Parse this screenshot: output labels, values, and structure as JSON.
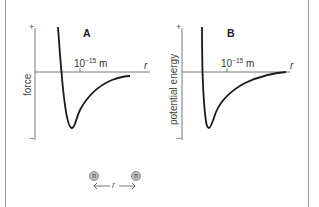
{
  "figure": {
    "panels": [
      {
        "id": "A",
        "label": "A",
        "ylabel": "force",
        "y_plus": "+",
        "y_minus": "−",
        "x_axis_label": "r",
        "tick_label_base": "10",
        "tick_label_exp": "−15",
        "tick_label_unit": " m"
      },
      {
        "id": "B",
        "label": "B",
        "ylabel": "potential energy",
        "y_plus": "+",
        "y_minus": "−",
        "x_axis_label": "r",
        "tick_label_base": "10",
        "tick_label_exp": "−15",
        "tick_label_unit": " m"
      }
    ],
    "inset": {
      "particle_left": "n",
      "particle_right": "n",
      "separation_label": "r",
      "arrow_left": "←",
      "arrow_right": "→"
    },
    "colors": {
      "curve": "#1a1a1a",
      "axis": "#777777",
      "border": "#9a9a9a",
      "particle_fill": "#bdbdbd"
    }
  }
}
